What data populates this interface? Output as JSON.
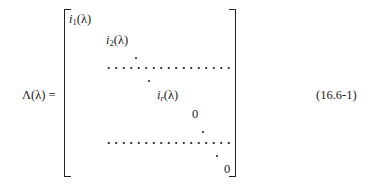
{
  "equation": {
    "lhs": "Λ(λ) =",
    "number": "(16.6-1)",
    "matrix": {
      "entries": [
        {
          "base": "i",
          "sub": "1",
          "arg": "(λ)"
        },
        {
          "base": "i",
          "sub": "2",
          "arg": "(λ)"
        },
        {
          "base": "i",
          "sub": "r",
          "arg": "(λ)"
        },
        {
          "value": "0"
        },
        {
          "value": "0"
        }
      ],
      "separator_rows": 2
    }
  }
}
